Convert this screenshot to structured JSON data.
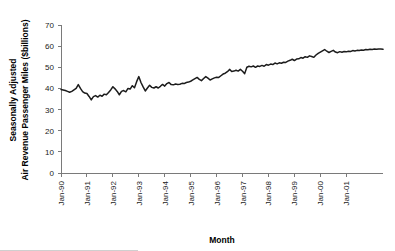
{
  "chart_data": {
    "type": "line",
    "title": "",
    "xlabel": "Month",
    "ylabel": "Seasonally Adjusted Air Revenue Passenger Miles ($billions)",
    "ylabel_line1": "Seasonally Adjusted",
    "ylabel_line2": "Air Revenue Passenger Miles ($billions)",
    "ylim": [
      0,
      70
    ],
    "yticks": [
      0,
      10,
      20,
      30,
      40,
      50,
      60,
      70
    ],
    "ytick_labels": [
      "0",
      "10",
      "20",
      "30",
      "40",
      "50",
      "60",
      "70"
    ],
    "xtick_labels": [
      "Jan-90",
      "Jan-91",
      "Jan-92",
      "Jan-93",
      "Jan-94",
      "Jan-95",
      "Jan-96",
      "Jan-97",
      "Jan-98",
      "Jan-99",
      "Jan-00",
      "Jan-01"
    ],
    "xtick_step_months": 12,
    "grid": false,
    "legend": "none",
    "line_color": "#1c1c1c",
    "axis_color": "#7a7a7a",
    "x_start": "Jan-90",
    "x_end": "Jun-02",
    "series": [
      {
        "name": "Seasonally Adjusted Air Revenue Passenger Miles",
        "values": [
          39.5,
          39.3,
          39.0,
          38.6,
          38.2,
          38.6,
          39.3,
          40.0,
          41.8,
          40.0,
          38.5,
          37.8,
          37.6,
          36.2,
          34.6,
          36.1,
          36.6,
          35.9,
          36.8,
          36.3,
          37.3,
          37.0,
          38.1,
          39.3,
          40.8,
          39.8,
          38.6,
          37.0,
          38.6,
          39.0,
          38.4,
          40.0,
          39.7,
          41.3,
          40.3,
          43.2,
          45.6,
          42.8,
          40.7,
          38.8,
          40.2,
          41.5,
          40.5,
          40.2,
          40.8,
          40.2,
          41.0,
          41.9,
          41.1,
          42.3,
          42.8,
          41.8,
          41.7,
          42.1,
          41.9,
          42.0,
          42.4,
          42.3,
          42.8,
          43.0,
          43.4,
          44.0,
          44.6,
          45.2,
          44.3,
          43.7,
          44.7,
          45.6,
          44.9,
          44.0,
          44.5,
          45.0,
          45.3,
          45.2,
          46.0,
          46.8,
          47.2,
          47.9,
          49.0,
          48.0,
          48.2,
          48.6,
          48.2,
          49.0,
          48.1,
          47.0,
          50.0,
          50.5,
          50.2,
          50.6,
          50.0,
          50.6,
          50.4,
          50.9,
          50.5,
          51.3,
          51.0,
          51.5,
          51.3,
          52.0,
          51.6,
          52.1,
          51.9,
          52.4,
          52.3,
          52.9,
          53.3,
          53.8,
          53.2,
          53.9,
          54.0,
          54.6,
          54.3,
          55.0,
          54.7,
          55.4,
          55.1,
          54.7,
          55.8,
          56.6,
          57.2,
          57.8,
          58.4,
          57.6,
          57.0,
          57.5,
          58.0,
          57.2,
          56.9,
          57.4,
          57.1,
          57.5,
          57.3,
          57.6,
          57.5,
          57.9,
          57.7,
          58.0,
          57.9,
          58.2,
          58.1,
          58.4,
          58.3,
          58.5,
          58.4,
          58.6,
          58.5,
          58.7,
          58.6,
          58.5
        ]
      }
    ]
  }
}
